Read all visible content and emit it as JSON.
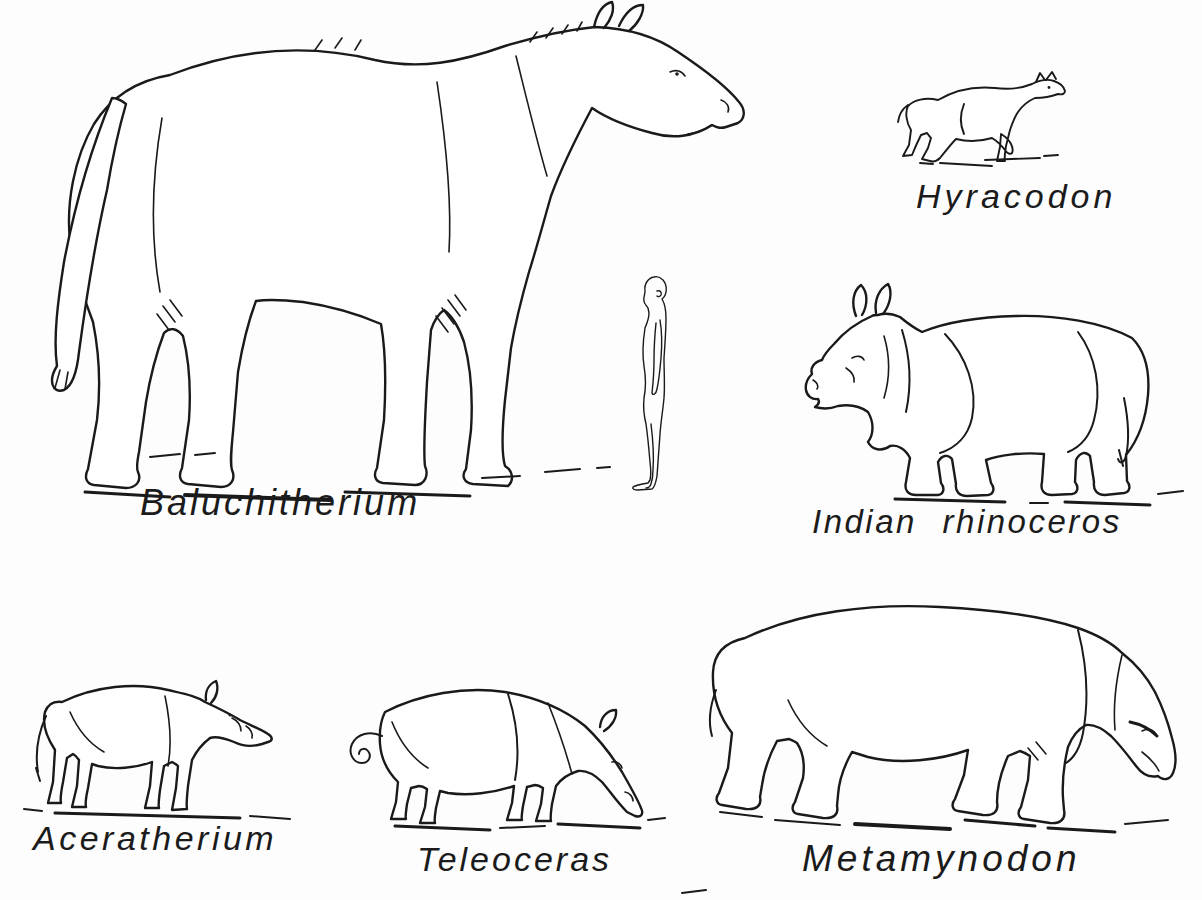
{
  "figure": {
    "kind": "zoological size-comparison plate",
    "paper_color": "#fdfdfd",
    "ink_color": "#1a1a1a"
  },
  "labels": {
    "baluchitherium": "Baluchitherium",
    "hyracodon": "Hyracodon",
    "indian_rhinoceros": "Indian rhinoceros",
    "aceratherium": "Aceratherium",
    "teleoceras": "Teleoceras",
    "metamynodon": "Metamynodon"
  },
  "figures": [
    {
      "id": "baluchitherium",
      "label": "Baluchitherium"
    },
    {
      "id": "hyracodon",
      "label": "Hyracodon"
    },
    {
      "id": "indian-rhinoceros",
      "label": "Indian rhinoceros"
    },
    {
      "id": "human",
      "label": ""
    },
    {
      "id": "aceratherium",
      "label": "Aceratherium"
    },
    {
      "id": "teleoceras",
      "label": "Teleoceras"
    },
    {
      "id": "metamynodon",
      "label": "Metamynodon"
    }
  ]
}
